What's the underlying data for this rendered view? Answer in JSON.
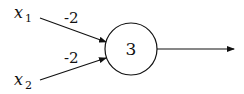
{
  "diagram": {
    "type": "perceptron",
    "inputs": [
      {
        "name": "x",
        "subscript": "1",
        "weight": "-2"
      },
      {
        "name": "x",
        "subscript": "2",
        "weight": "-2"
      }
    ],
    "neuron": {
      "bias": "3"
    },
    "output": {
      "label": ""
    }
  }
}
